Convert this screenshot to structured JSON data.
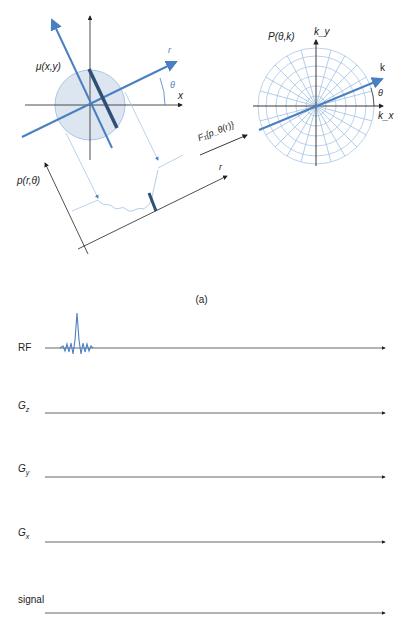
{
  "figure": {
    "caption": "(a)",
    "colors": {
      "accent_blue": "#4a7fc1",
      "light_blue": "#a9c6e6",
      "disk_fill": "#dde6f0",
      "strip_dark": "#2f4f75",
      "axis": "#222222"
    },
    "projection_panel": {
      "object_label": "μ(x,y)",
      "x_axis_label": "x",
      "rotated_axis_label": "r",
      "angle_label": "θ",
      "projection_label": "p(r,θ)",
      "projection_axis_label": "r"
    },
    "transform": {
      "label": "F₁{p_θ(r)}"
    },
    "kspace_panel": {
      "title": "P(θ,k)",
      "ky_label": "k_y",
      "kx_label": "k_x",
      "k_label": "k",
      "angle_label": "θ"
    },
    "pulse_sequence": {
      "rows": [
        {
          "label": "RF",
          "sub": "",
          "waveform": "sinc-pulse"
        },
        {
          "label": "G",
          "sub": "z",
          "waveform": "flat"
        },
        {
          "label": "G",
          "sub": "y",
          "waveform": "flat"
        },
        {
          "label": "G",
          "sub": "x",
          "waveform": "flat"
        },
        {
          "label": "signal",
          "sub": "",
          "waveform": "flat"
        }
      ]
    }
  }
}
